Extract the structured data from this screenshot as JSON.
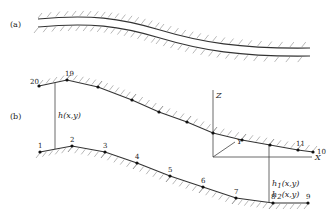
{
  "panel_a": {
    "label": "(a)"
  },
  "panel_b": {
    "label": "(b)",
    "upper_nodes": [
      {
        "id": "20",
        "x": 39,
        "y": 86
      },
      {
        "id": "19",
        "x": 67,
        "y": 80
      },
      {
        "id": "",
        "x": 98,
        "y": 87
      },
      {
        "id": "",
        "x": 132,
        "y": 100
      },
      {
        "id": "",
        "x": 159,
        "y": 112
      },
      {
        "id": "",
        "x": 187,
        "y": 122
      },
      {
        "id": "",
        "x": 213,
        "y": 133
      },
      {
        "id": "",
        "x": 242,
        "y": 140
      },
      {
        "id": "",
        "x": 270,
        "y": 145
      },
      {
        "id": "11",
        "x": 298,
        "y": 150
      },
      {
        "id": "10",
        "x": 313,
        "y": 152
      }
    ],
    "lower_nodes": [
      {
        "id": "1",
        "x": 40,
        "y": 152
      },
      {
        "id": "2",
        "x": 72,
        "y": 146
      },
      {
        "id": "3",
        "x": 105,
        "y": 152
      },
      {
        "id": "4",
        "x": 137,
        "y": 163
      },
      {
        "id": "5",
        "x": 170,
        "y": 176
      },
      {
        "id": "6",
        "x": 203,
        "y": 187
      },
      {
        "id": "7",
        "x": 236,
        "y": 198
      },
      {
        "id": "8",
        "x": 273,
        "y": 203
      },
      {
        "id": "9",
        "x": 308,
        "y": 203
      }
    ],
    "h_label": "h(x,y)",
    "h1_label": "h",
    "h1_sub": "1",
    "h1_args": "(x,y)",
    "h2_label": "h",
    "h2_sub": "2",
    "h2_args": "(x,y)",
    "axes": {
      "x": "X",
      "y": "Y",
      "z": "Z"
    }
  }
}
